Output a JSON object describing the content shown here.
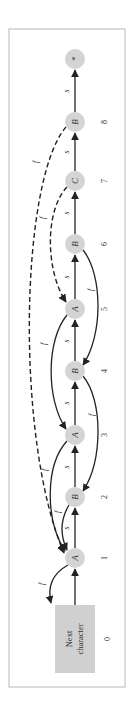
{
  "diagram": {
    "type": "failure-function automaton (rotated 90°)",
    "start_box": {
      "line1": "Next",
      "line2": "character",
      "index": "0"
    },
    "nodes": [
      {
        "index": "1",
        "label": "A"
      },
      {
        "index": "2",
        "label": "B"
      },
      {
        "index": "3",
        "label": "A"
      },
      {
        "index": "4",
        "label": "B"
      },
      {
        "index": "5",
        "label": "A"
      },
      {
        "index": "6",
        "label": "B"
      },
      {
        "index": "7",
        "label": "C"
      },
      {
        "index": "8",
        "label": "B"
      },
      {
        "index": "",
        "label": "*"
      }
    ],
    "success_label": "s",
    "failure_label": "f",
    "failure_edges": [
      {
        "from": "1",
        "to": "0",
        "style": "solid"
      },
      {
        "from": "2",
        "to": "1",
        "style": "solid"
      },
      {
        "from": "3",
        "to": "1",
        "style": "solid"
      },
      {
        "from": "4",
        "to": "2",
        "style": "solid"
      },
      {
        "from": "5",
        "to": "3",
        "style": "solid"
      },
      {
        "from": "6",
        "to": "4",
        "style": "solid"
      },
      {
        "from": "7",
        "to": "5",
        "style": "dashed"
      },
      {
        "from": "8",
        "to": "1",
        "style": "dashed"
      }
    ],
    "colors": {
      "node_fill": "#d4d4d4",
      "edge": "#222222",
      "frame": "#b8b8b8"
    }
  }
}
